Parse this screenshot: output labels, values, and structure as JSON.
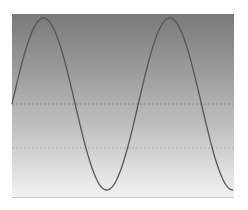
{
  "chart_data": {
    "type": "line",
    "title": "",
    "xlabel": "",
    "ylabel": "",
    "grid": true,
    "legend": null,
    "series": [
      {
        "name": "sine",
        "function": "sin",
        "cycles": 1.75,
        "color": "#555555",
        "x": [
          0,
          0.25,
          0.5,
          0.75,
          1.0,
          1.25,
          1.5,
          1.75
        ],
        "values": [
          0,
          1,
          0,
          -1,
          0,
          1,
          0,
          -1
        ]
      }
    ],
    "ylim": [
      -1.05,
      1.05
    ],
    "gridlines_y": [
      0,
      -0.5
    ],
    "background": {
      "top": "#7a7a7a",
      "bottom": "#f2f2f2"
    }
  }
}
